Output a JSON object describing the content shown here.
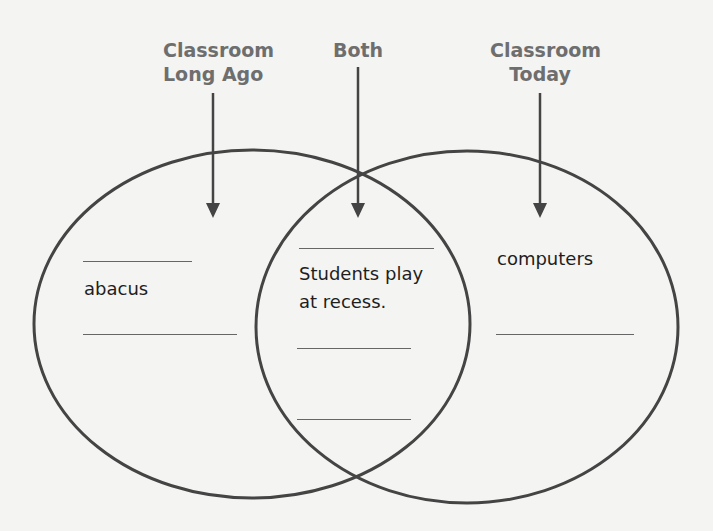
{
  "headings": {
    "left": {
      "line1": "Classroom",
      "line2": "Long Ago"
    },
    "center": {
      "line1": "Both"
    },
    "right": {
      "line1": "Classroom",
      "line2": "Today"
    }
  },
  "sections": {
    "left": {
      "entries": [
        "abacus"
      ],
      "blank_lines": 2
    },
    "both": {
      "entries": [
        "Students play",
        "at recess."
      ],
      "blank_lines": 3
    },
    "right": {
      "entries": [
        "computers"
      ],
      "blank_lines": 1
    }
  },
  "colors": {
    "heading": "#6e6e6e",
    "stroke": "#444444",
    "text": "#1e1e1e",
    "background": "#f4f4f2"
  }
}
